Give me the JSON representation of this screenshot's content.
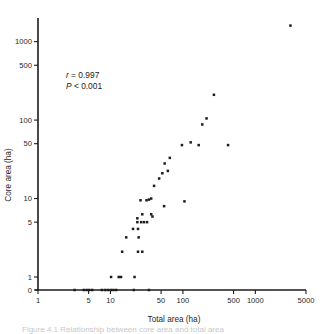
{
  "figure": {
    "background": "#ffffff",
    "point_color": "#1c1c1c",
    "axis_color": "#1b1b1b",
    "caption": "Figure 4.1  Relationship between core area and total area",
    "annotations": {
      "r_symbol": "r",
      "r_text": " = 0.997",
      "p_symbol": "P",
      "p_text": " < 0.001"
    }
  },
  "chart_data": {
    "type": "scatter",
    "title": "",
    "xlabel": "Total area (ha)",
    "ylabel": "Core area (ha)",
    "xscale": "log",
    "yscale": "log",
    "xlim": [
      1,
      5000
    ],
    "ylim": [
      0,
      2000
    ],
    "grid": false,
    "legend": null,
    "xticks": [
      1,
      5,
      10,
      50,
      100,
      500,
      1000,
      5000
    ],
    "xticklabels": [
      "1",
      "5",
      "10",
      "50",
      "100",
      "500",
      "1000",
      "5000"
    ],
    "yticks": [
      0,
      1,
      5,
      10,
      50,
      100,
      500,
      1000
    ],
    "yticklabels": [
      "0",
      "1",
      "5",
      "10",
      "50",
      "100",
      "500",
      "1000"
    ],
    "annotations": [
      {
        "text": "r = 0.997",
        "x": 5.2,
        "y": 330
      },
      {
        "text": "P < 0.001",
        "x": 5.2,
        "y": 250
      }
    ],
    "series": [
      {
        "name": "patches",
        "marker": "square",
        "color": "#1c1c1c",
        "points": [
          [
            3.2,
            0
          ],
          [
            4.3,
            0
          ],
          [
            4.7,
            0
          ],
          [
            5.1,
            0
          ],
          [
            5.6,
            0
          ],
          [
            7.6,
            0
          ],
          [
            8.4,
            0
          ],
          [
            9.2,
            0
          ],
          [
            10.1,
            0
          ],
          [
            11.0,
            0
          ],
          [
            12.0,
            0
          ],
          [
            21.0,
            0
          ],
          [
            34.0,
            0
          ],
          [
            10.2,
            1
          ],
          [
            13.0,
            1
          ],
          [
            14.0,
            1
          ],
          [
            21.5,
            1
          ],
          [
            14.5,
            2.1
          ],
          [
            24.0,
            2.1
          ],
          [
            27.5,
            2.1
          ],
          [
            16.5,
            3.2
          ],
          [
            24.5,
            3.2
          ],
          [
            20.5,
            4.1
          ],
          [
            24.0,
            4.1
          ],
          [
            23.5,
            5.0
          ],
          [
            26.5,
            5.0
          ],
          [
            29.0,
            5.0
          ],
          [
            32.0,
            5.0
          ],
          [
            23.5,
            5.6
          ],
          [
            27.5,
            6.3
          ],
          [
            36.5,
            6.3
          ],
          [
            38.0,
            5.9
          ],
          [
            26.0,
            9.5
          ],
          [
            31.5,
            9.5
          ],
          [
            34.0,
            9.7
          ],
          [
            36.5,
            10.0
          ],
          [
            105.0,
            9.2
          ],
          [
            55.0,
            8.0
          ],
          [
            40.0,
            14.5
          ],
          [
            47.0,
            18.0
          ],
          [
            52.0,
            21.0
          ],
          [
            62.0,
            22.5
          ],
          [
            56.0,
            28.0
          ],
          [
            66.0,
            33.0
          ],
          [
            97.0,
            48.0
          ],
          [
            128.0,
            52.0
          ],
          [
            165.0,
            48.0
          ],
          [
            420.0,
            48.0
          ],
          [
            185.0,
            88.0
          ],
          [
            212.0,
            105.0
          ],
          [
            268.0,
            210.0
          ],
          [
            3050.0,
            1600.0
          ]
        ]
      }
    ]
  }
}
